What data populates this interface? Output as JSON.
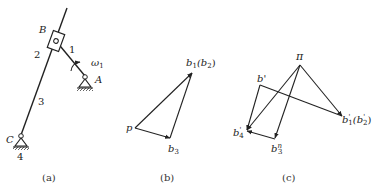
{
  "figure": {
    "panels": [
      {
        "id": "a",
        "caption": "(a)",
        "type": "mechanism",
        "labels": {
          "B": "B",
          "A": "A",
          "C": "C",
          "link1": "1",
          "link2": "2",
          "link3": "3",
          "frame": "4",
          "omega": "ω",
          "omega_sub": "1"
        }
      },
      {
        "id": "b",
        "caption": "(b)",
        "type": "velocity-polygon",
        "labels": {
          "p": "p",
          "b1": "b",
          "b1_sub": "1",
          "b2_paren": "(b",
          "b2_sub": "2",
          "close": ")",
          "b3": "b",
          "b3_sub": "3"
        }
      },
      {
        "id": "c",
        "caption": "(c)",
        "type": "acceleration-polygon",
        "labels": {
          "pi": "π",
          "bprime": "b'",
          "b4": "b",
          "b4_sup": "'",
          "b4_sub": "4",
          "b3": "b",
          "b3_sup": "n",
          "b3_sub": "3",
          "b1": "b",
          "b1_sup": "'",
          "b1_sub": "1",
          "b2_paren": "(b",
          "b2_sup": "'",
          "b2_sub": "2",
          "close": ")"
        }
      }
    ]
  },
  "colors": {
    "ink": "#222222"
  }
}
